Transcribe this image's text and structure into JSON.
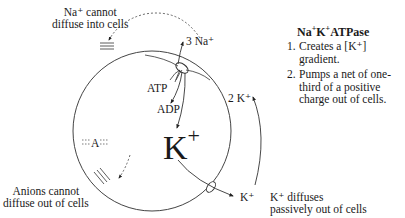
{
  "title": {
    "main": "Na",
    "sup1": "+",
    "mid": "K",
    "sup2": "+",
    "end": "ATPase"
  },
  "functions": [
    {
      "num": "1.",
      "text": "Creates a [K⁺] gradient."
    },
    {
      "num": "2.",
      "text": "Pumps a net of one-third of a positive charge out of cells."
    }
  ],
  "labels": {
    "na_cannot": [
      "Na⁺ cannot",
      "diffuse into cells"
    ],
    "anions_cannot": [
      "Anions cannot",
      "diffuse out of cells"
    ],
    "k_diffuses": [
      "K⁺ diffuses",
      "passively out of cells"
    ],
    "three_na": "3 Na⁺",
    "two_k": "2 K⁺",
    "atp": "ATP",
    "adp": "ADP",
    "anion": "A",
    "k_out": "K⁺",
    "big_k": "K",
    "big_k_sup": "+"
  },
  "colors": {
    "line": "#333333",
    "text": "#1a1a1a",
    "background": "#ffffff"
  }
}
